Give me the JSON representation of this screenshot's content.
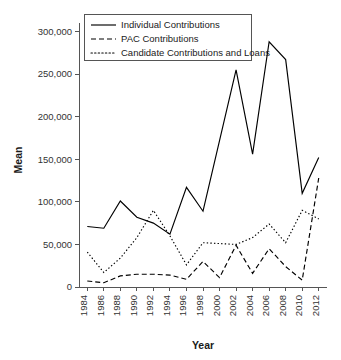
{
  "chart_data": {
    "type": "line",
    "title": "",
    "xlabel": "Year",
    "ylabel": "Mean",
    "grid": false,
    "legend_position": "top-left",
    "x": [
      1984,
      1986,
      1988,
      1990,
      1992,
      1994,
      1996,
      1998,
      2000,
      2002,
      2004,
      2006,
      2008,
      2010,
      2012
    ],
    "xtick_labels": [
      "1984",
      "1986",
      "1988",
      "1990",
      "1992",
      "1994",
      "1996",
      "1998",
      "2000",
      "2002",
      "2004",
      "2006",
      "2008",
      "2010",
      "2012"
    ],
    "ytick_labels": [
      "0",
      "50,000",
      "100,000",
      "150,000",
      "200,000",
      "250,000",
      "300,000"
    ],
    "ytick_values": [
      0,
      50000,
      100000,
      150000,
      200000,
      250000,
      300000
    ],
    "ylim": [
      0,
      310000
    ],
    "xlim": [
      1983,
      2013
    ],
    "series": [
      {
        "name": "Individual Contributions",
        "style": "solid",
        "values": [
          71000,
          69000,
          101000,
          82000,
          75000,
          62000,
          117000,
          89000,
          172000,
          255000,
          156000,
          288000,
          267000,
          110000,
          152000
        ]
      },
      {
        "name": "PAC Contributions",
        "style": "dashed",
        "values": [
          7000,
          5000,
          13000,
          15000,
          15000,
          14000,
          9000,
          30000,
          11000,
          49000,
          16000,
          45000,
          24000,
          8000,
          128000
        ]
      },
      {
        "name": "Candidate Contributions and Loans",
        "style": "dotted",
        "values": [
          41000,
          17000,
          34000,
          58000,
          90000,
          60000,
          26000,
          52000,
          51000,
          50000,
          58000,
          74000,
          52000,
          90000,
          80000
        ]
      }
    ]
  },
  "legend": {
    "items": [
      {
        "label": "Individual Contributions",
        "style": "solid"
      },
      {
        "label": "PAC Contributions",
        "style": "dashed"
      },
      {
        "label": "Candidate Contributions and Loans",
        "style": "dotted"
      }
    ]
  },
  "axes": {
    "x_title": "Year",
    "y_title": "Mean"
  }
}
